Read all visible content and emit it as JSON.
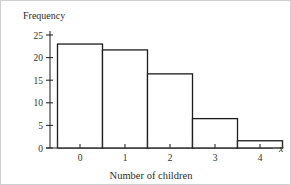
{
  "chart_data": {
    "type": "bar",
    "title": "",
    "subtitle": "",
    "xlabel": "Number of children",
    "ylabel": "Frequency",
    "x_variable_symbol": "x",
    "categories": [
      "0",
      "1",
      "2",
      "3",
      "4"
    ],
    "values": [
      23,
      21.7,
      16.4,
      6.5,
      1.6
    ],
    "xlim": [
      -0.5,
      4.5
    ],
    "ylim": [
      0,
      26
    ],
    "y_ticks": [
      "0",
      "5",
      "10",
      "15",
      "20",
      "25"
    ],
    "y_tick_values": [
      0,
      5,
      10,
      15,
      20,
      25
    ],
    "x_ticks": [
      "0",
      "1",
      "2",
      "3",
      "4"
    ],
    "x_tick_values": [
      0,
      1,
      2,
      3,
      4
    ],
    "bar_edges": [
      -0.5,
      0.5,
      1.5,
      2.5,
      3.5,
      4.5
    ],
    "grid": false,
    "legend": null,
    "bar_fill_color": "#ffffff",
    "bar_stroke_color": "#1c1c1c",
    "axis_color": "#2b2b2b"
  },
  "labels": {
    "y_axis_title": "Frequency",
    "x_axis_title": "Number of children",
    "x_axis_symbol": "x",
    "y_tick_0": "0",
    "y_tick_5": "5",
    "y_tick_10": "10",
    "y_tick_15": "15",
    "y_tick_20": "20",
    "y_tick_25": "25",
    "x_tick_0": "0",
    "x_tick_1": "1",
    "x_tick_2": "2",
    "x_tick_3": "3",
    "x_tick_4": "4"
  }
}
